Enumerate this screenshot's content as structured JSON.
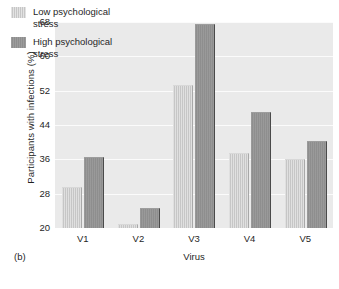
{
  "panel": {
    "label": "(b)"
  },
  "legend": {
    "position": "top-left",
    "entries": [
      {
        "label": "Low psychological\nstress",
        "color": "#c6c6c6",
        "name": "low-stress"
      },
      {
        "label": "High psychological\nstress",
        "color": "#8e8e8e",
        "name": "high-stress"
      }
    ]
  },
  "axes": {
    "y_title": "Participants with infections (%)",
    "x_title": "Virus",
    "y_ticks": [
      "20",
      "28",
      "36",
      "44",
      "52",
      "60",
      "68"
    ],
    "x_ticks": [
      "V1",
      "V2",
      "V3",
      "V4",
      "V5"
    ]
  },
  "chart_data": {
    "type": "bar",
    "title": "",
    "xlabel": "Virus",
    "ylabel": "Participants with infections (%)",
    "categories": [
      "V1",
      "V2",
      "V3",
      "V4",
      "V5"
    ],
    "series": [
      {
        "name": "Low psychological stress",
        "color": "#c6c6c6",
        "values": [
          29.3,
          20.8,
          53.2,
          37.2,
          35.8
        ]
      },
      {
        "name": "High psychological stress",
        "color": "#8e8e8e",
        "values": [
          36.3,
          24.5,
          67.3,
          46.8,
          40.0
        ]
      }
    ],
    "ylim": [
      20,
      68
    ],
    "ytick_step": 8,
    "grid": true,
    "grid_axis": "y",
    "legend_position": "top-left",
    "plot_background": "#e9e9e9"
  }
}
